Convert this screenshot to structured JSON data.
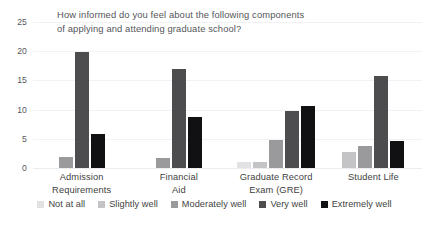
{
  "chart_data": {
    "type": "bar",
    "title": "How informed do you feel about the following components\nof applying and attending graduate school?",
    "xlabel": "",
    "ylabel": "",
    "ylim": [
      0,
      25
    ],
    "yticks": [
      0,
      5,
      10,
      15,
      20,
      25
    ],
    "grid": true,
    "legend_position": "bottom",
    "categories": [
      "Admission\nRequirements",
      "Financial\nAid",
      "Graduate Record\nExam (GRE)",
      "Student Life"
    ],
    "series": [
      {
        "name": "Not at all",
        "color": "#e2e2e4",
        "values": [
          0,
          0,
          1,
          0
        ]
      },
      {
        "name": "Slightly well",
        "color": "#c4c4c6",
        "values": [
          0,
          0,
          1,
          2.7
        ]
      },
      {
        "name": "Moderately well",
        "color": "#9a9a9c",
        "values": [
          1.9,
          1.8,
          4.8,
          3.7
        ]
      },
      {
        "name": "Very well",
        "color": "#4d4d50",
        "values": [
          19.9,
          16.9,
          9.7,
          15.8
        ]
      },
      {
        "name": "Extremely well",
        "color": "#111113",
        "values": [
          5.8,
          8.7,
          10.7,
          4.7
        ]
      }
    ]
  }
}
